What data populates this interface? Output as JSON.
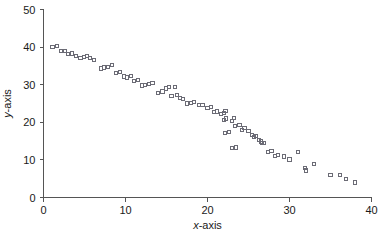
{
  "chart_data": {
    "type": "scatter",
    "title": "",
    "xlabel": "x-axis",
    "ylabel": "y-axis",
    "xlim": [
      0,
      40
    ],
    "ylim": [
      0,
      50
    ],
    "xticks": [
      0,
      10,
      20,
      30,
      40
    ],
    "yticks": [
      0,
      10,
      20,
      30,
      40,
      50
    ],
    "xtick_labels": [
      "0",
      "10",
      "20",
      "30",
      "40"
    ],
    "ytick_labels": [
      "0",
      "10",
      "20",
      "30",
      "40",
      "50"
    ],
    "grid": false,
    "legend": null,
    "marker_style": "open-square",
    "marker_color": "#6b6b75",
    "series": [
      {
        "name": "series-1",
        "points": [
          [
            1.1,
            40.0
          ],
          [
            1.6,
            40.3
          ],
          [
            2.1,
            39.0
          ],
          [
            2.6,
            38.9
          ],
          [
            3.0,
            38.1
          ],
          [
            3.5,
            38.3
          ],
          [
            4.0,
            37.6
          ],
          [
            4.5,
            37.2
          ],
          [
            4.9,
            37.4
          ],
          [
            5.3,
            37.6
          ],
          [
            5.7,
            37.2
          ],
          [
            6.2,
            36.6
          ],
          [
            7.0,
            34.3
          ],
          [
            7.4,
            34.6
          ],
          [
            7.9,
            34.7
          ],
          [
            8.4,
            35.3
          ],
          [
            8.8,
            33.1
          ],
          [
            9.3,
            33.4
          ],
          [
            9.8,
            32.2
          ],
          [
            10.2,
            31.9
          ],
          [
            10.7,
            32.4
          ],
          [
            11.0,
            31.0
          ],
          [
            11.5,
            31.3
          ],
          [
            12.0,
            29.8
          ],
          [
            12.4,
            30.0
          ],
          [
            12.9,
            30.2
          ],
          [
            13.3,
            30.4
          ],
          [
            14.0,
            27.9
          ],
          [
            14.5,
            28.2
          ],
          [
            14.9,
            29.0
          ],
          [
            15.3,
            29.3
          ],
          [
            15.6,
            27.1
          ],
          [
            16.0,
            29.4
          ],
          [
            16.3,
            27.3
          ],
          [
            16.6,
            26.4
          ],
          [
            17.0,
            26.2
          ],
          [
            17.5,
            25.0
          ],
          [
            18.0,
            25.2
          ],
          [
            18.4,
            25.4
          ],
          [
            19.0,
            24.5
          ],
          [
            19.4,
            24.7
          ],
          [
            20.0,
            23.9
          ],
          [
            20.4,
            24.1
          ],
          [
            20.8,
            22.8
          ],
          [
            21.2,
            22.9
          ],
          [
            21.6,
            22.2
          ],
          [
            22.0,
            22.4
          ],
          [
            22.2,
            23.1
          ],
          [
            22.0,
            20.7
          ],
          [
            22.3,
            21.0
          ],
          [
            22.1,
            17.2
          ],
          [
            22.6,
            17.4
          ],
          [
            23.0,
            20.3
          ],
          [
            23.2,
            21.2
          ],
          [
            23.4,
            19.0
          ],
          [
            23.0,
            13.1
          ],
          [
            23.5,
            13.3
          ],
          [
            23.9,
            19.3
          ],
          [
            24.2,
            18.0
          ],
          [
            24.5,
            18.4
          ],
          [
            25.0,
            17.6
          ],
          [
            25.4,
            16.6
          ],
          [
            25.7,
            16.1
          ],
          [
            25.9,
            16.3
          ],
          [
            26.3,
            15.4
          ],
          [
            26.5,
            14.9
          ],
          [
            26.6,
            14.4
          ],
          [
            26.9,
            14.6
          ],
          [
            27.4,
            12.1
          ],
          [
            27.8,
            12.3
          ],
          [
            28.2,
            11.0
          ],
          [
            28.6,
            11.2
          ],
          [
            29.3,
            10.9
          ],
          [
            30.0,
            10.1
          ],
          [
            31.0,
            12.0
          ],
          [
            31.9,
            7.8
          ],
          [
            32.0,
            7.2
          ],
          [
            33.0,
            9.0
          ],
          [
            35.0,
            5.9
          ],
          [
            36.2,
            5.9
          ],
          [
            36.9,
            4.9
          ],
          [
            38.0,
            4.0
          ]
        ]
      }
    ]
  }
}
